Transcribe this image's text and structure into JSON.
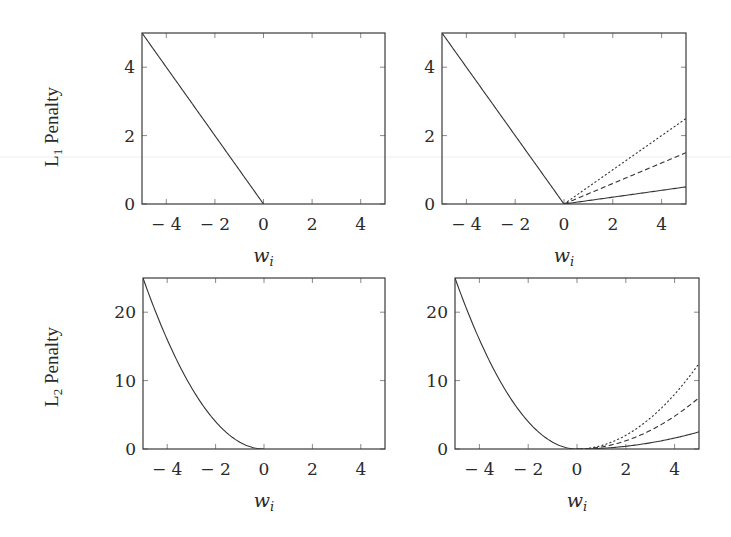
{
  "chart_data": [
    {
      "id": "l1-single",
      "type": "line",
      "ylabel": "L1 Penalty",
      "ylabel_main": "L",
      "ylabel_sub": "1",
      "ylabel_rest": " Penalty",
      "xlabel": "w",
      "xlabel_sub": "i",
      "xlim": [
        -5,
        5
      ],
      "ylim": [
        0,
        5
      ],
      "xticks": [
        -4,
        -2,
        0,
        2,
        4
      ],
      "xtick_labels": [
        "− 4",
        "− 2",
        "0",
        "2",
        "4"
      ],
      "yticks": [
        0,
        2,
        4
      ],
      "ytick_labels": [
        "0",
        "2",
        "4"
      ],
      "grid": false,
      "box": {
        "left": 142,
        "top": 33,
        "right": 385,
        "bottom": 204
      },
      "series": [
        {
          "name": "|w| (w<0)",
          "style": "solid",
          "formula": "l1",
          "coef": 1,
          "domain": [
            -5,
            0
          ],
          "x": [
            -5,
            -4,
            -2,
            0
          ],
          "y": [
            5,
            4,
            2,
            0
          ]
        }
      ]
    },
    {
      "id": "l1-scaled",
      "type": "line",
      "xlabel": "w",
      "xlabel_sub": "i",
      "xlim": [
        -5,
        5
      ],
      "ylim": [
        0,
        5
      ],
      "xticks": [
        -4,
        -2,
        0,
        2,
        4
      ],
      "xtick_labels": [
        "− 4",
        "− 2",
        "0",
        "2",
        "4"
      ],
      "yticks": [
        0,
        2,
        4
      ],
      "ytick_labels": [
        "0",
        "2",
        "4"
      ],
      "grid": false,
      "box": {
        "left": 442,
        "top": 33,
        "right": 686,
        "bottom": 204
      },
      "series": [
        {
          "name": "|w| (w<0)",
          "style": "solid",
          "formula": "l1",
          "coef": 1,
          "domain": [
            -5,
            0
          ],
          "x": [
            -5,
            0
          ],
          "y": [
            5,
            0
          ]
        },
        {
          "name": "0.5·w",
          "style": "dotted",
          "formula": "l1",
          "coef": 0.5,
          "domain": [
            0,
            5
          ],
          "x": [
            0,
            5
          ],
          "y": [
            0,
            2.5
          ]
        },
        {
          "name": "0.3·w",
          "style": "dashed",
          "formula": "l1",
          "coef": 0.3,
          "domain": [
            0,
            5
          ],
          "x": [
            0,
            5
          ],
          "y": [
            0,
            1.5
          ]
        },
        {
          "name": "0.1·w",
          "style": "solid",
          "formula": "l1",
          "coef": 0.1,
          "domain": [
            0,
            5
          ],
          "x": [
            0,
            5
          ],
          "y": [
            0,
            0.5
          ]
        }
      ]
    },
    {
      "id": "l2-single",
      "type": "line",
      "ylabel": "L2 Penalty",
      "ylabel_main": "L",
      "ylabel_sub": "2",
      "ylabel_rest": " Penalty",
      "xlabel": "w",
      "xlabel_sub": "i",
      "xlim": [
        -5,
        5
      ],
      "ylim": [
        0,
        25
      ],
      "xticks": [
        -4,
        -2,
        0,
        2,
        4
      ],
      "xtick_labels": [
        "− 4",
        "− 2",
        "0",
        "2",
        "4"
      ],
      "yticks": [
        0,
        10,
        20
      ],
      "ytick_labels": [
        "0",
        "10",
        "20"
      ],
      "grid": false,
      "box": {
        "left": 143,
        "top": 278,
        "right": 385,
        "bottom": 449
      },
      "series": [
        {
          "name": "w² (w<0)",
          "style": "solid",
          "formula": "l2",
          "coef": 1,
          "domain": [
            -5,
            0
          ],
          "x": [
            -5,
            -4,
            -3,
            -2,
            -1,
            0
          ],
          "y": [
            25,
            16,
            9,
            4,
            1,
            0
          ]
        }
      ]
    },
    {
      "id": "l2-scaled",
      "type": "line",
      "xlabel": "w",
      "xlabel_sub": "i",
      "xlim": [
        -5,
        5
      ],
      "ylim": [
        0,
        25
      ],
      "xticks": [
        -4,
        -2,
        0,
        2,
        4
      ],
      "xtick_labels": [
        "− 4",
        "− 2",
        "0",
        "2",
        "4"
      ],
      "yticks": [
        0,
        10,
        20
      ],
      "ytick_labels": [
        "0",
        "10",
        "20"
      ],
      "grid": false,
      "box": {
        "left": 455,
        "top": 278,
        "right": 699,
        "bottom": 449
      },
      "series": [
        {
          "name": "w² (w<0)",
          "style": "solid",
          "formula": "l2",
          "coef": 1,
          "domain": [
            -5,
            0
          ],
          "x": [
            -5,
            -4,
            -3,
            -2,
            -1,
            0
          ],
          "y": [
            25,
            16,
            9,
            4,
            1,
            0
          ]
        },
        {
          "name": "0.5·w²",
          "style": "dotted",
          "formula": "l2",
          "coef": 0.5,
          "domain": [
            0,
            5
          ],
          "x": [
            0,
            1,
            2,
            3,
            4,
            5
          ],
          "y": [
            0,
            0.5,
            2,
            4.5,
            8,
            12.5
          ]
        },
        {
          "name": "0.3·w²",
          "style": "dashed",
          "formula": "l2",
          "coef": 0.3,
          "domain": [
            0,
            5
          ],
          "x": [
            0,
            1,
            2,
            3,
            4,
            5
          ],
          "y": [
            0,
            0.3,
            1.2,
            2.7,
            4.8,
            7.5
          ]
        },
        {
          "name": "0.1·w²",
          "style": "solid",
          "formula": "l2",
          "coef": 0.1,
          "domain": [
            0,
            5
          ],
          "x": [
            0,
            1,
            2,
            3,
            4,
            5
          ],
          "y": [
            0,
            0.1,
            0.4,
            0.9,
            1.6,
            2.5
          ]
        }
      ]
    }
  ],
  "row_labels": [
    {
      "main": "L",
      "sub": "1",
      "rest": " Penalty",
      "cx": 52,
      "cy": 127
    },
    {
      "main": "L",
      "sub": "2",
      "rest": " Penalty",
      "cx": 52,
      "cy": 367
    }
  ],
  "styles": {
    "line_color": "#333333",
    "frame_color": "#3a3a3a",
    "background": "#ffffff",
    "artifact_line_color": "#ececec"
  }
}
